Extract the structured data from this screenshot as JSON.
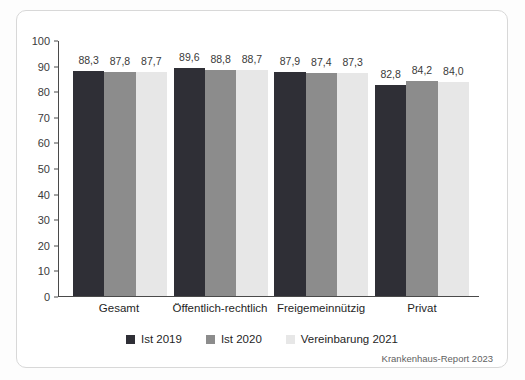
{
  "source_note": "Krankenhaus-Report 2023",
  "chart_data": {
    "type": "bar",
    "title": "",
    "xlabel": "",
    "ylabel": "",
    "categories": [
      "Gesamt",
      "Öffentlich-rechtlich",
      "Freigemeinnützig",
      "Privat"
    ],
    "series": [
      {
        "name": "Ist 2019",
        "color": "#2f2f36",
        "values": [
          88.3,
          89.6,
          87.9,
          82.8
        ],
        "labels": [
          "88,3",
          "89,6",
          "87,9",
          "82,8"
        ]
      },
      {
        "name": "Ist 2020",
        "color": "#8c8c8c",
        "values": [
          87.8,
          88.8,
          87.4,
          84.2
        ],
        "labels": [
          "87,8",
          "88,8",
          "87,4",
          "84,2"
        ]
      },
      {
        "name": "Vereinbarung 2021",
        "color": "#e7e7e7",
        "values": [
          87.7,
          88.7,
          87.3,
          84.0
        ],
        "labels": [
          "87,7",
          "88,7",
          "87,3",
          "84,0"
        ]
      }
    ],
    "ylim": [
      0,
      100
    ],
    "yticks": [
      0,
      10,
      20,
      30,
      40,
      50,
      60,
      70,
      80,
      90,
      100
    ],
    "grid": false,
    "legend_position": "bottom"
  }
}
